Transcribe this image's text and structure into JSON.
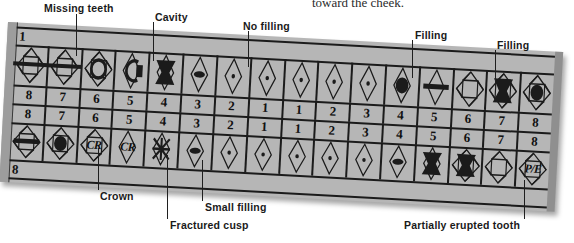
{
  "figure": {
    "top_sentence": "toward the cheek.",
    "background_color": "#b6b6b6",
    "ink_color": "#1b1b1b"
  },
  "quadrant_labels": {
    "upper_left_corner": "1",
    "lower_left_corner": "8"
  },
  "rows": {
    "upper_left_numbers": [
      "8",
      "7",
      "6",
      "5",
      "4",
      "3",
      "2",
      "1"
    ],
    "upper_right_numbers": [
      "1",
      "2",
      "3",
      "4",
      "5",
      "6",
      "7",
      "8"
    ],
    "lower_left_numbers": [
      "8",
      "7",
      "6",
      "5",
      "4",
      "3",
      "2",
      "1"
    ],
    "lower_right_numbers": [
      "1",
      "2",
      "3",
      "4",
      "5",
      "6",
      "7",
      "8"
    ]
  },
  "chart_data": {
    "type": "table",
    "quadrants": [
      {
        "name": "upper-left",
        "arch": "upper",
        "side": "left",
        "corner_number": "1",
        "teeth": [
          {
            "number": "8",
            "mark": "missing-bar",
            "condition": "Missing teeth"
          },
          {
            "number": "7",
            "mark": "missing-bar",
            "condition": "Missing teeth"
          },
          {
            "number": "6",
            "mark": "cavity-ring",
            "condition": "Cavity outline"
          },
          {
            "number": "5",
            "mark": "cavity-open",
            "condition": "Cavity"
          },
          {
            "number": "4",
            "mark": "filling-solid",
            "condition": "Filling"
          },
          {
            "number": "3",
            "mark": "small-filling",
            "condition": "Small filling"
          },
          {
            "number": "2",
            "mark": "dot",
            "condition": "No filling"
          },
          {
            "number": "1",
            "mark": "dot",
            "condition": "No filling"
          }
        ]
      },
      {
        "name": "upper-right",
        "arch": "upper",
        "side": "right",
        "teeth": [
          {
            "number": "1",
            "mark": "dot",
            "condition": "No filling"
          },
          {
            "number": "2",
            "mark": "dot",
            "condition": "No filling"
          },
          {
            "number": "3",
            "mark": "dot",
            "condition": "No filling"
          },
          {
            "number": "4",
            "mark": "filling-round",
            "condition": "Filling"
          },
          {
            "number": "5",
            "mark": "filling-bar",
            "condition": "Filling"
          },
          {
            "number": "6",
            "mark": "none",
            "condition": ""
          },
          {
            "number": "7",
            "mark": "filling-solid",
            "condition": "Filling"
          },
          {
            "number": "8",
            "mark": "filling-round",
            "condition": "Filling"
          }
        ]
      },
      {
        "name": "lower-left",
        "arch": "lower",
        "side": "left",
        "corner_number": "8",
        "teeth": [
          {
            "number": "8",
            "mark": "filling-bar",
            "condition": "Filling"
          },
          {
            "number": "7",
            "mark": "filling-round",
            "condition": "Filling"
          },
          {
            "number": "6",
            "mark": "crown-cr",
            "label": "CR",
            "condition": "Crown"
          },
          {
            "number": "5",
            "mark": "crown-cr",
            "label": "CR",
            "condition": "Crown"
          },
          {
            "number": "4",
            "mark": "fractured-x",
            "condition": "Fractured cusp"
          },
          {
            "number": "3",
            "mark": "small-filling",
            "condition": "Small filling"
          },
          {
            "number": "2",
            "mark": "dot",
            "condition": "No filling"
          },
          {
            "number": "1",
            "mark": "dot",
            "condition": "No filling"
          }
        ]
      },
      {
        "name": "lower-right",
        "arch": "lower",
        "side": "right",
        "teeth": [
          {
            "number": "1",
            "mark": "dot",
            "condition": "No filling"
          },
          {
            "number": "2",
            "mark": "dot",
            "condition": "No filling"
          },
          {
            "number": "3",
            "mark": "dot",
            "condition": "No filling"
          },
          {
            "number": "4",
            "mark": "small-filling",
            "condition": "Small filling"
          },
          {
            "number": "5",
            "mark": "filling-solid",
            "condition": "Filling"
          },
          {
            "number": "6",
            "mark": "filling-solid",
            "condition": "Filling"
          },
          {
            "number": "7",
            "mark": "none",
            "condition": ""
          },
          {
            "number": "8",
            "mark": "partially-erupted",
            "label": "P/E",
            "condition": "Partially erupted tooth"
          }
        ]
      }
    ]
  },
  "annotations": {
    "missing_teeth": "Missing teeth",
    "cavity": "Cavity",
    "no_filling": "No filling",
    "filling_1": "Filling",
    "filling_2": "Filling",
    "crown": "Crown",
    "fractured_cusp": "Fractured cusp",
    "small_filling": "Small filling",
    "partially_erupted": "Partially erupted tooth"
  }
}
